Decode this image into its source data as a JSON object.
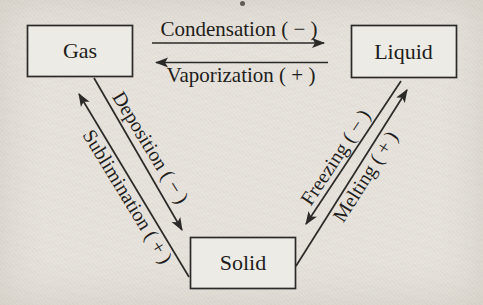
{
  "diagram": {
    "colors": {
      "paper_background": "#e6e2db",
      "box_fill": "#edebe5",
      "ink": "#2b2a28"
    },
    "nodes": [
      {
        "id": "gas",
        "label": "Gas"
      },
      {
        "id": "liquid",
        "label": "Liquid"
      },
      {
        "id": "solid",
        "label": "Solid"
      }
    ],
    "transitions": [
      {
        "id": "condensation",
        "label": "Condensation ( − )",
        "from": "Gas",
        "to": "Liquid",
        "sign": "−"
      },
      {
        "id": "vaporization",
        "label": "Vaporization ( + )",
        "from": "Liquid",
        "to": "Gas",
        "sign": "+"
      },
      {
        "id": "deposition",
        "label": "Deposition ( − )",
        "from": "Gas",
        "to": "Solid",
        "sign": "−"
      },
      {
        "id": "sublimination",
        "label": "Sublimination ( + )",
        "from": "Solid",
        "to": "Gas",
        "sign": "+"
      },
      {
        "id": "freezing",
        "label": "Freezing ( − )",
        "from": "Liquid",
        "to": "Solid",
        "sign": "−"
      },
      {
        "id": "melting",
        "label": "Melting ( + )",
        "from": "Solid",
        "to": "Liquid",
        "sign": "+"
      }
    ]
  }
}
